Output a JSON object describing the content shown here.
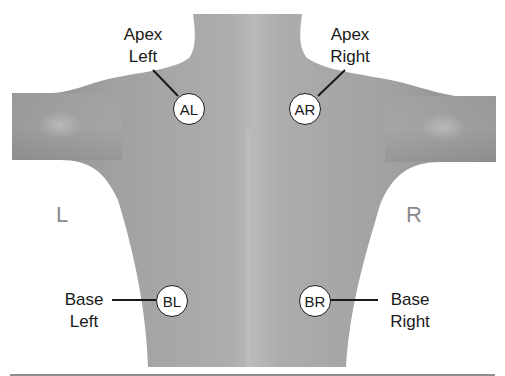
{
  "diagram": {
    "side_labels": {
      "left": "L",
      "right": "R"
    },
    "colors": {
      "body_fill": "#9a9a9a",
      "body_highlight": "#b8b8b8",
      "outline": "#1a1a1a",
      "side_label": "#8a8a8a",
      "badge_fill": "#ffffff"
    },
    "points": [
      {
        "id": "AL",
        "badge": "AL",
        "label_line1": "Apex",
        "label_line2": "Left"
      },
      {
        "id": "AR",
        "badge": "AR",
        "label_line1": "Apex",
        "label_line2": "Right"
      },
      {
        "id": "BL",
        "badge": "BL",
        "label_line1": "Base",
        "label_line2": "Left"
      },
      {
        "id": "BR",
        "badge": "BR",
        "label_line1": "Base",
        "label_line2": "Right"
      }
    ]
  }
}
